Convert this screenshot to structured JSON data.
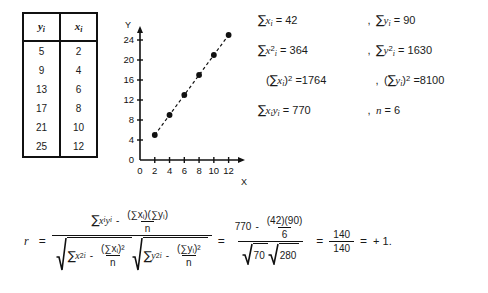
{
  "table": {
    "headers": [
      "yᵢ",
      "xᵢ"
    ],
    "header_base": [
      "y",
      "x"
    ],
    "header_sub": [
      "i",
      "i"
    ],
    "rows": [
      {
        "y": "5",
        "x": "2"
      },
      {
        "y": "9",
        "x": "4"
      },
      {
        "y": "13",
        "x": "6"
      },
      {
        "y": "17",
        "x": "8"
      },
      {
        "y": "21",
        "x": "10"
      },
      {
        "y": "25",
        "x": "12"
      }
    ]
  },
  "chart_data": {
    "type": "scatter",
    "title": "",
    "xlabel": "X",
    "ylabel": "Y",
    "x": [
      2,
      4,
      6,
      8,
      10,
      12
    ],
    "y": [
      5,
      9,
      13,
      17,
      21,
      25
    ],
    "xticks": [
      0,
      2,
      4,
      6,
      8,
      10,
      12
    ],
    "yticks": [
      0,
      4,
      8,
      12,
      16,
      20,
      24
    ],
    "xlim": [
      0,
      13
    ],
    "ylim": [
      0,
      26
    ],
    "grid": false,
    "legend": null,
    "trendline": {
      "style": "dashed",
      "from": [
        2,
        5
      ],
      "to": [
        12,
        25
      ]
    },
    "marker": "filled-circle",
    "marker_color": "#111111"
  },
  "summary": {
    "rows": [
      {
        "left": {
          "sigma": "∑",
          "base": "x",
          "sub": "i",
          "sup": "",
          "eq": "=",
          "value": "42"
        },
        "sep": ",",
        "right": {
          "sigma": "∑",
          "base": "y",
          "sub": "i",
          "sup": "",
          "eq": "=",
          "value": "90"
        }
      },
      {
        "left": {
          "sigma": "∑",
          "base": "x",
          "sub": "i",
          "sup": "2",
          "eq": "=",
          "value": "364"
        },
        "sep": ",",
        "right": {
          "sigma": "∑",
          "base": "y",
          "sub": "i",
          "sup": "2",
          "eq": "=",
          "value": "1630"
        }
      },
      {
        "left": {
          "paren_open": "(",
          "sigma": "∑",
          "base": "x",
          "sub": "i",
          "paren_close": ")",
          "sup": "2",
          "eq": "=",
          "value": "1764"
        },
        "sep": ",",
        "right": {
          "paren_open": "(",
          "sigma": "∑",
          "base": "y",
          "sub": "i",
          "paren_close": ")",
          "sup": "2",
          "eq": "=",
          "value": "8100"
        }
      },
      {
        "left": {
          "sigma": "∑",
          "base": "x",
          "sub": "i",
          "base2": "y",
          "sub2": "i",
          "eq": "=",
          "value": "770"
        },
        "sep": ",",
        "right": {
          "base": "n",
          "eq": "=",
          "value": "6"
        }
      }
    ]
  },
  "formula": {
    "lead": "r",
    "eq1": "=",
    "eq2": "=",
    "eq3": "=",
    "symbolic": {
      "numerator": {
        "term1": {
          "sigma": "∑",
          "base": "x",
          "sub": "i",
          "base2": "y",
          "sub2": "i"
        },
        "minus": "-",
        "frac_num": "(∑xᵢ)(∑yᵢ)",
        "frac_den": "n"
      },
      "denominator": {
        "radical1": {
          "term": {
            "sigma": "∑",
            "base": "x",
            "sub": "i",
            "sup": "2"
          },
          "minus": "-",
          "frac_num": "(∑xᵢ)²",
          "frac_den": "n"
        },
        "radical2": {
          "term": {
            "sigma": "∑",
            "base": "y",
            "sub": "i",
            "sup": "2"
          },
          "minus": "-",
          "frac_num": "(∑yᵢ)²",
          "frac_den": "n"
        }
      }
    },
    "numeric": {
      "num_first": "770",
      "num_minus": "-",
      "num_frac_num": "(42)(90)",
      "num_frac_den": "6",
      "den_sqrt1": "70",
      "den_sqrt2": "280"
    },
    "result": {
      "num": "140",
      "den": "140"
    },
    "final": "+ 1."
  },
  "colors": {
    "ink": "#1a1a1a",
    "rule": "#111111",
    "background": "#ffffff"
  }
}
